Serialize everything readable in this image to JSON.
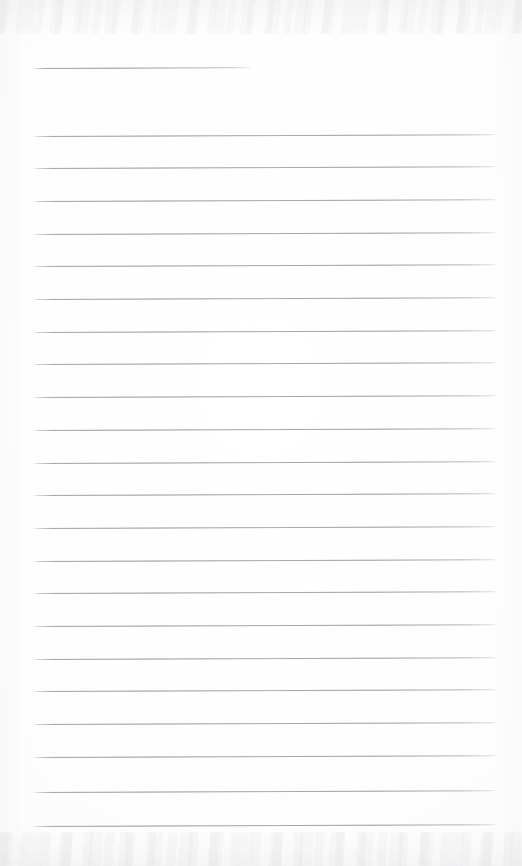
{
  "document": {
    "type": "scanned-ruled-notepad-page",
    "title": "Blank ruled notepad page",
    "orientation": "portrait",
    "width_px": 522,
    "height_px": 866,
    "background_color": "#fdfdfd",
    "rule_color": "#7e8088",
    "edge_tint_color": "#acaeb8",
    "content_text": "",
    "has_handwriting": false,
    "has_printed_text": false
  },
  "ruling": {
    "left_margin_px": 34,
    "right_edge_px": 495,
    "line_spacing_px": 32.7,
    "line_thickness_px": 1,
    "slope_deg": -0.22,
    "short_rule_count": 1,
    "full_rule_count": 22,
    "total_rule_count": 23,
    "short_rule_label": "signature-rule",
    "full_rule_label": "writing-rule"
  },
  "rules": [
    {
      "name": "signature-rule",
      "y": 68,
      "x1": 34,
      "x2": 250,
      "kind": "short"
    },
    {
      "name": "writing-rule-1",
      "y": 135.5,
      "x1": 34,
      "x2": 495,
      "kind": "full"
    },
    {
      "name": "writing-rule-2",
      "y": 168.2,
      "x1": 34,
      "x2": 495,
      "kind": "full"
    },
    {
      "name": "writing-rule-3",
      "y": 200.9,
      "x1": 34,
      "x2": 495,
      "kind": "full"
    },
    {
      "name": "writing-rule-4",
      "y": 233.6,
      "x1": 34,
      "x2": 495,
      "kind": "full"
    },
    {
      "name": "writing-rule-5",
      "y": 266.3,
      "x1": 34,
      "x2": 495,
      "kind": "full"
    },
    {
      "name": "writing-rule-6",
      "y": 299.0,
      "x1": 34,
      "x2": 495,
      "kind": "full"
    },
    {
      "name": "writing-rule-7",
      "y": 331.7,
      "x1": 34,
      "x2": 495,
      "kind": "full"
    },
    {
      "name": "writing-rule-8",
      "y": 364.4,
      "x1": 34,
      "x2": 495,
      "kind": "full"
    },
    {
      "name": "writing-rule-9",
      "y": 397.1,
      "x1": 34,
      "x2": 495,
      "kind": "full"
    },
    {
      "name": "writing-rule-10",
      "y": 429.8,
      "x1": 34,
      "x2": 495,
      "kind": "full"
    },
    {
      "name": "writing-rule-11",
      "y": 462.5,
      "x1": 34,
      "x2": 495,
      "kind": "full"
    },
    {
      "name": "writing-rule-12",
      "y": 495.2,
      "x1": 34,
      "x2": 495,
      "kind": "full"
    },
    {
      "name": "writing-rule-13",
      "y": 527.9,
      "x1": 34,
      "x2": 495,
      "kind": "full"
    },
    {
      "name": "writing-rule-14",
      "y": 560.6,
      "x1": 34,
      "x2": 495,
      "kind": "full"
    },
    {
      "name": "writing-rule-15",
      "y": 593.3,
      "x1": 34,
      "x2": 495,
      "kind": "full"
    },
    {
      "name": "writing-rule-16",
      "y": 626.0,
      "x1": 34,
      "x2": 495,
      "kind": "full"
    },
    {
      "name": "writing-rule-17",
      "y": 658.7,
      "x1": 34,
      "x2": 495,
      "kind": "full"
    },
    {
      "name": "writing-rule-18",
      "y": 691.4,
      "x1": 34,
      "x2": 495,
      "kind": "full"
    },
    {
      "name": "writing-rule-19",
      "y": 724.1,
      "x1": 34,
      "x2": 495,
      "kind": "full"
    },
    {
      "name": "writing-rule-20",
      "y": 756.8,
      "x1": 34,
      "x2": 495,
      "kind": "full"
    },
    {
      "name": "writing-rule-21",
      "y": 792.0,
      "x1": 34,
      "x2": 495,
      "kind": "full"
    },
    {
      "name": "writing-rule-22",
      "y": 826.0,
      "x1": 34,
      "x2": 495,
      "kind": "full"
    }
  ]
}
